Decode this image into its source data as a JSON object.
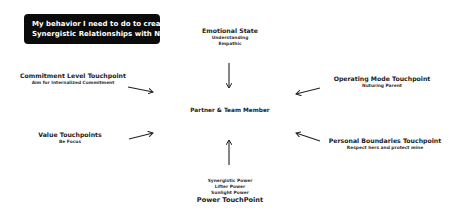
{
  "title": {
    "line1": "My behavior I need to do to create",
    "line2": "Synergistic Relationships with Nicki"
  },
  "center": {
    "label": "Partner & Team Member"
  },
  "nodes": {
    "emotional_state": {
      "heading": "Emotional State",
      "sub": [
        "Understanding",
        "Empathic"
      ]
    },
    "commitment_level": {
      "heading": "Commitment Level Touchpoint",
      "sub": [
        "Aim for Internalized Commitment"
      ]
    },
    "operating_mode": {
      "heading": "Operating Mode Touchpoint",
      "sub": [
        "Nuturing Parent"
      ]
    },
    "value": {
      "heading": "Value Touchpoints",
      "sub": [
        "Be Focus"
      ]
    },
    "personal_boundaries": {
      "heading": "Personal Boundaries Touchpoint",
      "sub": [
        "Respect hers and protect mine"
      ]
    },
    "power": {
      "heading": "Power TouchPoint",
      "sub": [
        "Synergistic Power",
        "Lifter Power",
        "Sunlight Power"
      ]
    }
  },
  "arrows": [
    {
      "from": "emotional_state",
      "to": "center",
      "direction": "down"
    },
    {
      "from": "commitment_level",
      "to": "center",
      "direction": "right-down"
    },
    {
      "from": "operating_mode",
      "to": "center",
      "direction": "left-down"
    },
    {
      "from": "value",
      "to": "center",
      "direction": "right-up"
    },
    {
      "from": "personal_boundaries",
      "to": "center",
      "direction": "left-up"
    },
    {
      "from": "power",
      "to": "center",
      "direction": "up"
    }
  ],
  "colors": {
    "title_bg": "#0b0b0b",
    "title_fg": "#ffffff",
    "text": "#222222",
    "arrow": "#222222"
  }
}
